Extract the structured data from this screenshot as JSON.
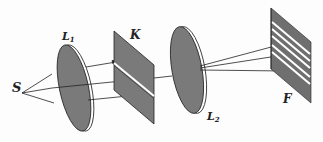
{
  "figure": {
    "labels": {
      "source": "S",
      "lens1_main": "L",
      "lens1_sub": "1",
      "plate": "K",
      "lens2_main": "L",
      "lens2_sub": "2",
      "screen": "F"
    },
    "colors": {
      "fill": "#7a7a7a",
      "stroke": "#222222",
      "highlight": "#ffffff"
    },
    "fringe_count": 5
  }
}
